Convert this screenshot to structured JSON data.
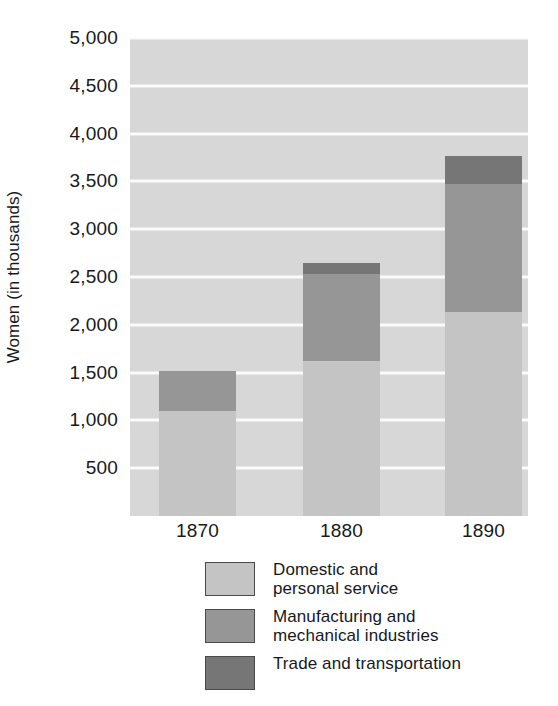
{
  "chart_data": {
    "type": "bar",
    "subtype": "stacked-vertical",
    "title": "",
    "xlabel": "",
    "ylabel": "Women (in thousands)",
    "categories": [
      "1870",
      "1880",
      "1890"
    ],
    "series": [
      {
        "name": "Domestic and\npersonal service",
        "color": "#c4c4c4",
        "values": [
          1100,
          1620,
          2130
        ]
      },
      {
        "name": "Manufacturing and\nmechanical industries",
        "color": "#969696",
        "values": [
          420,
          910,
          1340
        ]
      },
      {
        "name": "Trade and transportation",
        "color": "#767676",
        "values": [
          0,
          120,
          300
        ]
      }
    ],
    "totals": [
      1520,
      2650,
      3770
    ],
    "ylim": [
      0,
      5000
    ],
    "ytick_values": [
      500,
      1000,
      1500,
      2000,
      2500,
      3000,
      3500,
      4000,
      4500,
      5000
    ],
    "ytick_labels": [
      "500",
      "1,000",
      "1,500",
      "2,000",
      "2,500",
      "3,000",
      "3,500",
      "4,000",
      "4,500",
      "5,000"
    ],
    "grid": "horizontal",
    "gridline_color": "#fbfbfb",
    "plot_background": "#d7d7d7",
    "legend_position": "bottom"
  },
  "axes": {
    "y_title": "Women (in thousands)"
  },
  "legend": {
    "items": [
      {
        "label": "Domestic and\npersonal service",
        "color": "#c4c4c4"
      },
      {
        "label": "Manufacturing and\nmechanical industries",
        "color": "#969696"
      },
      {
        "label": "Trade and transportation",
        "color": "#767676"
      }
    ]
  }
}
